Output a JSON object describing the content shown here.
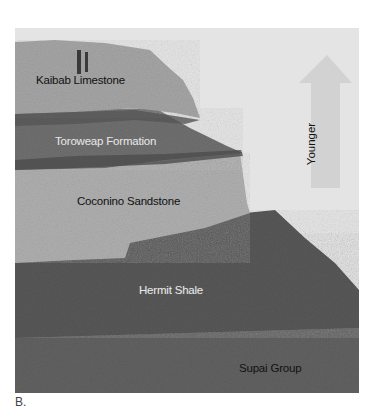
{
  "figure": {
    "caption": "B.",
    "arrow": {
      "label": "Younger",
      "color": "#cfcfcf"
    },
    "colors": {
      "sky": "#e4e4e4",
      "kaibab": "#a8a8a8",
      "toroweap": "#6e6e6e",
      "coconino": "#b2b2b2",
      "hermit": "#5c5c5c",
      "supai": "#6a6a6a"
    },
    "layers": [
      {
        "name": "Kaibab Limestone",
        "label_color": "dark"
      },
      {
        "name": "Toroweap Formation",
        "label_color": "light"
      },
      {
        "name": "Coconino Sandstone",
        "label_color": "dark"
      },
      {
        "name": "Hermit Shale",
        "label_color": "light"
      },
      {
        "name": "Supai Group",
        "label_color": "dark"
      }
    ]
  }
}
